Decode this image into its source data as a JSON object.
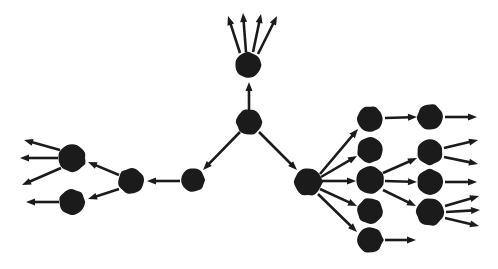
{
  "diagram": {
    "type": "node-link-diagram",
    "width": 498,
    "height": 269,
    "background_color": "#ffffff",
    "node_color": "#1b1b1b",
    "edge_color": "#1b1b1b",
    "node_radius": 13,
    "edge_width": 2.6,
    "arrowhead_length": 9,
    "arrowhead_width": 7,
    "node_count": 15,
    "edge_count": 31,
    "nodes": [
      {
        "id": "n-top",
        "label": "",
        "cx": 248,
        "cy": 65,
        "r": 13
      },
      {
        "id": "n-center",
        "label": "",
        "cx": 249,
        "cy": 122,
        "r": 13
      },
      {
        "id": "n-mid-left",
        "label": "",
        "cx": 193,
        "cy": 180,
        "r": 12
      },
      {
        "id": "n-left-hub",
        "label": "",
        "cx": 131,
        "cy": 181,
        "r": 13
      },
      {
        "id": "n-left-upper",
        "label": "",
        "cx": 72,
        "cy": 158,
        "r": 14
      },
      {
        "id": "n-left-lower",
        "label": "",
        "cx": 72,
        "cy": 202,
        "r": 13
      },
      {
        "id": "n-right-hub",
        "label": "",
        "cx": 308,
        "cy": 182,
        "r": 14
      },
      {
        "id": "n-r1-a",
        "label": "",
        "cx": 370,
        "cy": 119,
        "r": 13
      },
      {
        "id": "n-r1-b",
        "label": "",
        "cx": 370,
        "cy": 150,
        "r": 13
      },
      {
        "id": "n-r1-c",
        "label": "",
        "cx": 370,
        "cy": 180,
        "r": 14
      },
      {
        "id": "n-r1-d",
        "label": "",
        "cx": 370,
        "cy": 211,
        "r": 13
      },
      {
        "id": "n-r1-e",
        "label": "",
        "cx": 370,
        "cy": 240,
        "r": 13
      },
      {
        "id": "n-r2-a",
        "label": "",
        "cx": 430,
        "cy": 117,
        "r": 13
      },
      {
        "id": "n-r2-b",
        "label": "",
        "cx": 430,
        "cy": 152,
        "r": 13
      },
      {
        "id": "n-r2-c",
        "label": "",
        "cx": 430,
        "cy": 182,
        "r": 13
      },
      {
        "id": "n-r2-d",
        "label": "",
        "cx": 430,
        "cy": 212,
        "r": 14
      }
    ],
    "edges": [
      {
        "id": "e-center-top",
        "from": "n-center",
        "to": "n-top",
        "x1": 249,
        "y1": 110,
        "x2": 249,
        "y2": 82
      },
      {
        "id": "e-center-left",
        "from": "n-center",
        "to": "n-mid-left",
        "x1": 240,
        "y1": 132,
        "x2": 203,
        "y2": 170
      },
      {
        "id": "e-center-right",
        "from": "n-center",
        "to": "n-right-hub",
        "x1": 259,
        "y1": 132,
        "x2": 297,
        "y2": 170
      },
      {
        "id": "e-midleft-hub",
        "from": "n-mid-left",
        "to": "n-left-hub",
        "x1": 180,
        "y1": 181,
        "x2": 147,
        "y2": 181
      },
      {
        "id": "e-hub-upper",
        "from": "n-left-hub",
        "to": "n-left-upper",
        "x1": 119,
        "y1": 175,
        "x2": 88,
        "y2": 162
      },
      {
        "id": "e-hub-lower",
        "from": "n-left-hub",
        "to": "n-left-lower",
        "x1": 119,
        "y1": 189,
        "x2": 88,
        "y2": 199
      },
      {
        "id": "e-upper-out1",
        "from": "n-left-upper",
        "to": null,
        "x1": 60,
        "y1": 150,
        "x2": 24,
        "y2": 140
      },
      {
        "id": "e-upper-out2",
        "from": "n-left-upper",
        "to": null,
        "x1": 58,
        "y1": 158,
        "x2": 20,
        "y2": 158
      },
      {
        "id": "e-upper-out3",
        "from": "n-left-upper",
        "to": null,
        "x1": 61,
        "y1": 168,
        "x2": 22,
        "y2": 185
      },
      {
        "id": "e-lower-out1",
        "from": "n-left-lower",
        "to": null,
        "x1": 59,
        "y1": 202,
        "x2": 26,
        "y2": 202
      },
      {
        "id": "e-top-out1",
        "from": "n-top",
        "to": null,
        "x1": 240,
        "y1": 53,
        "x2": 228,
        "y2": 16
      },
      {
        "id": "e-top-out2",
        "from": "n-top",
        "to": null,
        "x1": 246,
        "y1": 52,
        "x2": 243,
        "y2": 13
      },
      {
        "id": "e-top-out3",
        "from": "n-top",
        "to": null,
        "x1": 253,
        "y1": 52,
        "x2": 261,
        "y2": 14
      },
      {
        "id": "e-top-out4",
        "from": "n-top",
        "to": null,
        "x1": 258,
        "y1": 54,
        "x2": 277,
        "y2": 16
      },
      {
        "id": "e-rhub-r1a",
        "from": "n-right-hub",
        "to": "n-r1-a",
        "x1": 320,
        "y1": 174,
        "x2": 358,
        "y2": 129
      },
      {
        "id": "e-rhub-r1b",
        "from": "n-right-hub",
        "to": "n-r1-b",
        "x1": 321,
        "y1": 177,
        "x2": 357,
        "y2": 156
      },
      {
        "id": "e-rhub-r1c",
        "from": "n-right-hub",
        "to": "n-r1-c",
        "x1": 322,
        "y1": 181,
        "x2": 356,
        "y2": 181
      },
      {
        "id": "e-rhub-r1d",
        "from": "n-right-hub",
        "to": "n-r1-d",
        "x1": 320,
        "y1": 189,
        "x2": 357,
        "y2": 206
      },
      {
        "id": "e-rhub-r1e",
        "from": "n-right-hub",
        "to": "n-r1-e",
        "x1": 318,
        "y1": 194,
        "x2": 357,
        "y2": 232
      },
      {
        "id": "e-r1a-r2a",
        "from": "n-r1-a",
        "to": "n-r2-a",
        "x1": 385,
        "y1": 118,
        "x2": 417,
        "y2": 117
      },
      {
        "id": "e-r1c-r2b",
        "from": "n-r1-c",
        "to": "n-r2-b",
        "x1": 383,
        "y1": 173,
        "x2": 417,
        "y2": 158
      },
      {
        "id": "e-r1c-r2c",
        "from": "n-r1-c",
        "to": "n-r2-c",
        "x1": 385,
        "y1": 181,
        "x2": 417,
        "y2": 182
      },
      {
        "id": "e-r1c-r2d",
        "from": "n-r1-c",
        "to": "n-r2-d",
        "x1": 383,
        "y1": 190,
        "x2": 416,
        "y2": 206
      },
      {
        "id": "e-r1e-out1",
        "from": "n-r1-e",
        "to": null,
        "x1": 385,
        "y1": 240,
        "x2": 416,
        "y2": 240
      },
      {
        "id": "e-r2a-out1",
        "from": "n-r2-a",
        "to": null,
        "x1": 445,
        "y1": 117,
        "x2": 477,
        "y2": 117
      },
      {
        "id": "e-r2b-out1",
        "from": "n-r2-b",
        "to": null,
        "x1": 444,
        "y1": 148,
        "x2": 478,
        "y2": 140
      },
      {
        "id": "e-r2b-out2",
        "from": "n-r2-b",
        "to": null,
        "x1": 444,
        "y1": 157,
        "x2": 478,
        "y2": 164
      },
      {
        "id": "e-r2c-out1",
        "from": "n-r2-c",
        "to": null,
        "x1": 445,
        "y1": 182,
        "x2": 477,
        "y2": 182
      },
      {
        "id": "e-r2d-out1",
        "from": "n-r2-d",
        "to": null,
        "x1": 445,
        "y1": 206,
        "x2": 479,
        "y2": 196
      },
      {
        "id": "e-r2d-out2",
        "from": "n-r2-d",
        "to": null,
        "x1": 446,
        "y1": 212,
        "x2": 480,
        "y2": 210
      },
      {
        "id": "e-r2d-out3",
        "from": "n-r2-d",
        "to": null,
        "x1": 445,
        "y1": 218,
        "x2": 479,
        "y2": 226
      }
    ]
  }
}
